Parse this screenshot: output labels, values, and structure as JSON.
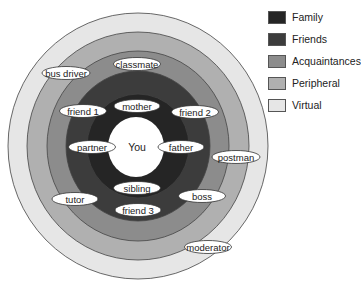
{
  "diagram": {
    "center_label": "You",
    "rings": [
      {
        "name": "Virtual",
        "color": "#e6e6e6",
        "rx": 130,
        "ry": 133
      },
      {
        "name": "Peripheral",
        "color": "#b0b0b0",
        "rx": 111,
        "ry": 114
      },
      {
        "name": "Acquaintances",
        "color": "#8c8c8c",
        "rx": 91,
        "ry": 95
      },
      {
        "name": "Friends",
        "color": "#3c3c3c",
        "rx": 72,
        "ry": 75
      },
      {
        "name": "Family",
        "color": "#252525",
        "rx": 51,
        "ry": 52
      }
    ],
    "people": [
      {
        "label": "classmate",
        "x": 137,
        "y": 64,
        "w": 47
      },
      {
        "label": "bus driver",
        "x": 66,
        "y": 73,
        "w": 48
      },
      {
        "label": "mother",
        "x": 137,
        "y": 106,
        "w": 46
      },
      {
        "label": "friend 1",
        "x": 83,
        "y": 111,
        "w": 47
      },
      {
        "label": "friend 2",
        "x": 195,
        "y": 112,
        "w": 47
      },
      {
        "label": "partner",
        "x": 92,
        "y": 147,
        "w": 47
      },
      {
        "label": "father",
        "x": 181,
        "y": 147,
        "w": 46
      },
      {
        "label": "postman",
        "x": 236,
        "y": 157,
        "w": 48
      },
      {
        "label": "sibling",
        "x": 137,
        "y": 188,
        "w": 47
      },
      {
        "label": "tutor",
        "x": 75,
        "y": 199,
        "w": 46
      },
      {
        "label": "boss",
        "x": 202,
        "y": 196,
        "w": 47
      },
      {
        "label": "friend 3",
        "x": 138,
        "y": 210,
        "w": 46
      },
      {
        "label": "moderator",
        "x": 208,
        "y": 247,
        "w": 47
      }
    ]
  },
  "legend": {
    "items": [
      {
        "label": "Family",
        "color": "#252525"
      },
      {
        "label": "Friends",
        "color": "#3c3c3c"
      },
      {
        "label": "Acquaintances",
        "color": "#8c8c8c"
      },
      {
        "label": "Peripheral",
        "color": "#b0b0b0"
      },
      {
        "label": "Virtual",
        "color": "#e6e6e6"
      }
    ]
  }
}
